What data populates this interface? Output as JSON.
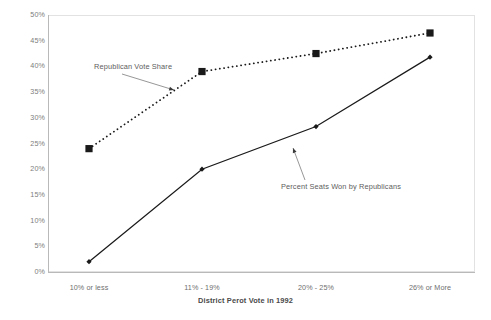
{
  "chart_data": {
    "type": "line",
    "title": "",
    "xlabel": "District Perot Vote in 1992",
    "ylabel": "",
    "categories": [
      "10% or less",
      "11% - 19%",
      "20% - 25%",
      "26% or More"
    ],
    "ylim": [
      0,
      50
    ],
    "yticks": [
      "0%",
      "5%",
      "10%",
      "15%",
      "20%",
      "25%",
      "30%",
      "35%",
      "40%",
      "45%",
      "50%"
    ],
    "ytick_values": [
      0,
      5,
      10,
      15,
      20,
      25,
      30,
      35,
      40,
      45,
      50
    ],
    "grid": false,
    "legend": "annotations",
    "series": [
      {
        "name": "Republican Vote Share",
        "values": [
          24,
          39,
          42.5,
          46.5
        ],
        "style": "dotted",
        "marker": "square",
        "color": "#1a1a1a"
      },
      {
        "name": "Percent Seats Won by Republicans",
        "values": [
          2,
          20,
          28.3,
          41.8
        ],
        "style": "solid",
        "marker": "diamond",
        "color": "#1a1a1a"
      }
    ],
    "annotations": [
      {
        "text": "Republican Vote Share",
        "points_to_series": "Republican Vote Share",
        "points_to_category": "11% - 19%"
      },
      {
        "text": "Percent Seats Won by Republicans",
        "points_to_series": "Percent Seats Won by Republicans",
        "points_to_category": "20% - 25%"
      }
    ]
  },
  "axis": {
    "x_title": "District Perot Vote in 1992"
  }
}
